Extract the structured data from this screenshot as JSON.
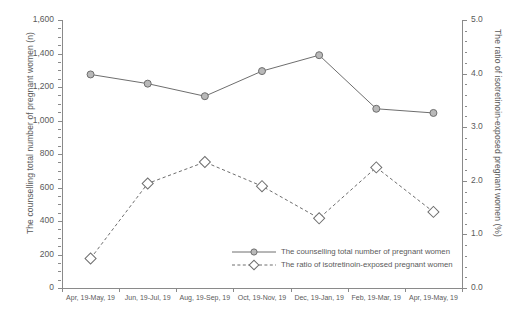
{
  "chart_data": {
    "type": "line",
    "title": "",
    "xlabel": "",
    "categories": [
      "Apr, 19-May, 19",
      "Jun, 19-Jul, 19",
      "Aug, 19-Sep, 19",
      "Oct, 19-Nov, 19",
      "Dec, 19-Jan, 19",
      "Feb, 19-Mar, 19",
      "Apr, 19-May, 19"
    ],
    "series": [
      {
        "name": "The counselling total number of pregnant women",
        "axis": "left",
        "style": "solid",
        "marker": "circle",
        "values": [
          1275,
          1220,
          1145,
          1295,
          1390,
          1070,
          1045
        ]
      },
      {
        "name": "The ratio of isotretinoin-exposed pregnant women",
        "axis": "right",
        "style": "dashed",
        "marker": "diamond",
        "values": [
          0.55,
          1.95,
          2.35,
          1.9,
          1.3,
          2.25,
          1.42
        ]
      }
    ],
    "y_left": {
      "label": "The counselling total number of pregnant women (n)",
      "ylim": [
        0,
        1600
      ],
      "ticks": [
        "0",
        "200",
        "400",
        "600",
        "800",
        "1,000",
        "1,200",
        "1,400",
        "1,600"
      ],
      "tick_values": [
        0,
        200,
        400,
        600,
        800,
        1000,
        1200,
        1400,
        1600
      ]
    },
    "y_right": {
      "label": "The ratio of isotretinoin-exposed pregnant women (%)",
      "ylim": [
        0,
        5
      ],
      "ticks": [
        "0.0",
        "1.0",
        "2.0",
        "3.0",
        "4.0",
        "5.0"
      ],
      "tick_values": [
        0,
        1,
        2,
        3,
        4,
        5
      ]
    },
    "grid": false,
    "legend_position": "inside-lower-right",
    "colors": {
      "line": "#6e6e6e",
      "marker_fill": "#b9b9b9",
      "marker_edge": "#6e6e6e",
      "marker_fill_open": "#ffffff",
      "axis": "#8a8a8a",
      "text": "#5a5a5a"
    }
  },
  "legend": {
    "items": [
      {
        "label": "The counselling total number of pregnant women",
        "icon": "solid-line-circle-marker"
      },
      {
        "label": "The ratio of isotretinoin-exposed pregnant women",
        "icon": "dashed-line-diamond-marker"
      }
    ]
  }
}
